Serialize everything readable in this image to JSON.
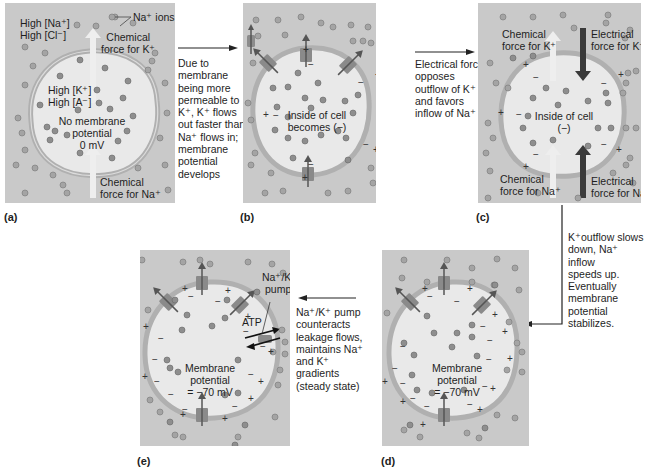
{
  "panels": {
    "a": {
      "label": "(a)",
      "outside_line1": "High [Na⁺]",
      "outside_line2": "High [Cl⁻]",
      "ions_callout": "Na⁺ ions",
      "chem_k_line1": "Chemical",
      "chem_k_line2": "force for K⁺",
      "inside_line1": "High [K⁺]",
      "inside_line2": "High [A⁻]",
      "center_line1": "No membrane",
      "center_line2": "potential",
      "center_line3": "0 mV",
      "chem_na_line1": "Chemical",
      "chem_na_line2": "force for Na⁺"
    },
    "b": {
      "label": "(b)",
      "center_line1": "Inside of cell",
      "center_line2": "becomes (−)"
    },
    "c": {
      "label": "(c)",
      "chem_k_line1": "Chemical",
      "chem_k_line2": "force for K⁺",
      "elec_k_line1": "Electrical",
      "elec_k_line2": "force for K⁺",
      "center_line1": "Inside of cell",
      "center_line2": "(−)",
      "chem_na_line1": "Chemical",
      "chem_na_line2": "force for Na⁺",
      "elec_na_line1": "Electrical",
      "elec_na_line2": "force for Na⁺"
    },
    "d": {
      "label": "(d)",
      "center_line1": "Membrane",
      "center_line2": "potential",
      "center_line3": "= −70 mV"
    },
    "e": {
      "label": "(e)",
      "pump_line1": "Na⁺/K⁺",
      "pump_line2": "pump",
      "atp": "ATP",
      "center_line1": "Membrane",
      "center_line2": "potential",
      "center_line3": "= −70 mV"
    }
  },
  "captions": {
    "a_to_b": [
      "Due to",
      "membrane",
      "being more",
      "permeable to",
      "K⁺, K⁺ flows",
      "out faster than",
      "Na⁺ flows in;",
      "membrane",
      "potential",
      "develops"
    ],
    "b_to_c": [
      "Electrical force",
      "opposes",
      "outflow of K⁺",
      "and favors",
      "inflow of Na⁺"
    ],
    "c_to_d": [
      "K⁺outflow slows",
      "down, Na⁺ inflow",
      "speeds up.",
      "Eventually",
      "membrane",
      "potential stabilizes."
    ],
    "d_to_e": [
      "Na⁺/K⁺ pump",
      "counteracts",
      "leakage flows,",
      "maintains Na⁺",
      "and K⁺",
      "gradients",
      "(steady state)"
    ]
  },
  "colors": {
    "panel_bg": "#c9c9c9",
    "cell_fill": "#e9e9e9",
    "membrane": "#b5b5b5",
    "ion": "#9a9a9a",
    "light_arrow": "#eeeeee",
    "dark_arrow": "#3a3a3a",
    "channel": "#8c8c8c"
  }
}
